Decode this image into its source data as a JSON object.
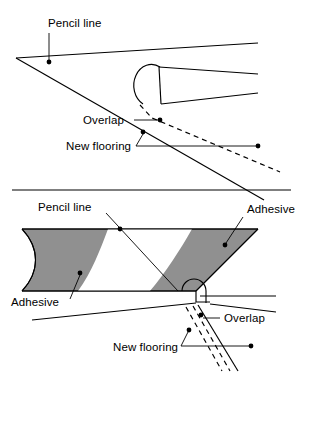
{
  "figure": {
    "background_color": "#ffffff",
    "line_color": "#000000",
    "adhesive_color": "#909090",
    "panels": [
      {
        "id": "upper",
        "name": "rolling-out-new-flooring",
        "labels": [
          {
            "key": "pencil_line",
            "text": "Pencil line"
          },
          {
            "key": "overlap",
            "text": "Overlap"
          },
          {
            "key": "new_flooring",
            "text": "New flooring"
          }
        ]
      },
      {
        "id": "lower",
        "name": "adhesive-spread-detail",
        "labels": [
          {
            "key": "pencil_line",
            "text": "Pencil line"
          },
          {
            "key": "adhesive_right",
            "text": "Adhesive"
          },
          {
            "key": "adhesive_left",
            "text": "Adhesive"
          },
          {
            "key": "overlap",
            "text": "Overlap"
          },
          {
            "key": "new_flooring",
            "text": "New flooring"
          }
        ]
      }
    ]
  },
  "upper_panel": {
    "pencil_line_label": "Pencil line",
    "overlap_label": "Overlap",
    "new_flooring_label": "New flooring"
  },
  "lower_panel": {
    "pencil_line_label": "Pencil line",
    "adhesive_label_right": "Adhesive",
    "adhesive_label_left": "Adhesive",
    "overlap_label": "Overlap",
    "new_flooring_label": "New flooring"
  }
}
